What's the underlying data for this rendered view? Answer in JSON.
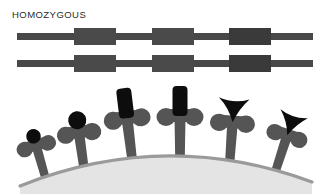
{
  "figure": {
    "title": "HOMOZYGOUS",
    "canvas": {
      "width": 330,
      "height": 194,
      "background": "#ffffff"
    }
  },
  "palette": {
    "strand": "#484848",
    "gene_block_light": "#4a4a4a",
    "gene_block_dark": "#3a3a3a",
    "head_black": "#0d0d0d",
    "body_gray": "#555555",
    "hill_fill": "#e4e4e4",
    "hill_edge": "#9a9a9a",
    "title_text": "#2b2b2b"
  },
  "chromosomes": {
    "label": "HOMOZYGOUS",
    "count": 2,
    "strand": {
      "x": 17,
      "width": 296,
      "thickness": 7
    },
    "rows": [
      {
        "name": "chromosome-top",
        "y": 33
      },
      {
        "name": "chromosome-bottom",
        "y": 60
      }
    ],
    "gene_blocks": [
      {
        "name": "gene-block-1",
        "x": 74,
        "width": 42,
        "height": 17,
        "fill": "#4a4a4a"
      },
      {
        "name": "gene-block-2",
        "x": 152,
        "width": 42,
        "height": 17,
        "fill": "#4a4a4a"
      },
      {
        "name": "gene-block-3",
        "x": 229,
        "width": 42,
        "height": 17,
        "fill": "#3a3a3a"
      }
    ]
  },
  "population": {
    "hill": {
      "name": "hill",
      "fill": "#e4e4e4",
      "edge": "#9a9a9a"
    },
    "organisms": [
      {
        "name": "organism-1",
        "head_shape": "round",
        "head_label": "round-head",
        "x": 38,
        "head_y": 146,
        "head_size": 15,
        "body_scale": 0.86,
        "rotation": -16
      },
      {
        "name": "organism-2",
        "head_shape": "round",
        "head_label": "round-head",
        "x": 80,
        "head_y": 130,
        "head_size": 17,
        "body_scale": 0.95,
        "rotation": -8
      },
      {
        "name": "organism-3",
        "head_shape": "rectangle",
        "head_label": "tall-rectangle-head",
        "x": 128,
        "head_y": 112,
        "head_size": 18,
        "body_scale": 1.0,
        "rotation": -7
      },
      {
        "name": "organism-4",
        "head_shape": "rectangle",
        "head_label": "tall-rectangle-head",
        "x": 180,
        "head_y": 110,
        "head_size": 18,
        "body_scale": 1.0,
        "rotation": 0
      },
      {
        "name": "organism-5",
        "head_shape": "arrow",
        "head_label": "arrow-head",
        "x": 232,
        "head_y": 116,
        "head_size": 20,
        "body_scale": 0.96,
        "rotation": 4
      },
      {
        "name": "organism-6",
        "head_shape": "arrow",
        "head_label": "arrow-head",
        "x": 285,
        "head_y": 128,
        "head_size": 20,
        "body_scale": 0.9,
        "rotation": 18
      }
    ]
  }
}
